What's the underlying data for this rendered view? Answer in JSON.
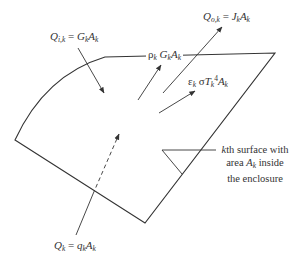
{
  "diagram": {
    "type": "radiation energy balance on an enclosure surface",
    "colors": {
      "line": "#333333",
      "background": "#ffffff"
    },
    "labels": {
      "incident": {
        "Q": "Q",
        "sub": "i,k",
        "eq": " = ",
        "G": "G",
        "G_sub": "k",
        "A": "A",
        "A_sub": "k"
      },
      "outgoing": {
        "Q": "Q",
        "sub": "o,k",
        "eq": " = ",
        "J": "J",
        "J_sub": "k",
        "A": "A",
        "A_sub": "k"
      },
      "reflected": {
        "rho": "ρ",
        "rho_sub": "k",
        "G": " G",
        "G_sub": "k",
        "A": "A",
        "A_sub": "k"
      },
      "emitted": {
        "eps": "ε",
        "eps_sub": "k",
        "sigma": " σ",
        "T": "T",
        "T_sub": "k",
        "T_sup": "4",
        "A": "A",
        "A_sub": "k"
      },
      "net": {
        "Q": "Q",
        "Q_sub": "k",
        "eq": " = ",
        "q": "q",
        "q_sub": "k",
        "A": "A",
        "A_sub": "k"
      }
    },
    "annotation": {
      "line1_k": "k",
      "line1_rest": "th surface with",
      "line2_pre": "area ",
      "line2_A": "A",
      "line2_sub": "k",
      "line2_post": " inside",
      "line3": "the enclosure"
    }
  }
}
